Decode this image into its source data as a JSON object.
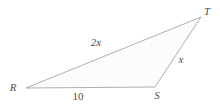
{
  "diagram": {
    "type": "triangle",
    "vertices": [
      {
        "label": "R",
        "position": "bottom-left"
      },
      {
        "label": "S",
        "position": "bottom-right"
      },
      {
        "label": "T",
        "position": "top-right"
      }
    ],
    "sides": [
      {
        "endpoints": "RT",
        "label": "2x"
      },
      {
        "endpoints": "ST",
        "label": "x"
      },
      {
        "endpoints": "RS",
        "label": "10"
      }
    ],
    "colors": {
      "line": "#9b9b9b",
      "fill": "#fcfcfc",
      "text": "#4d4d4d",
      "background": "#ffffff"
    }
  }
}
